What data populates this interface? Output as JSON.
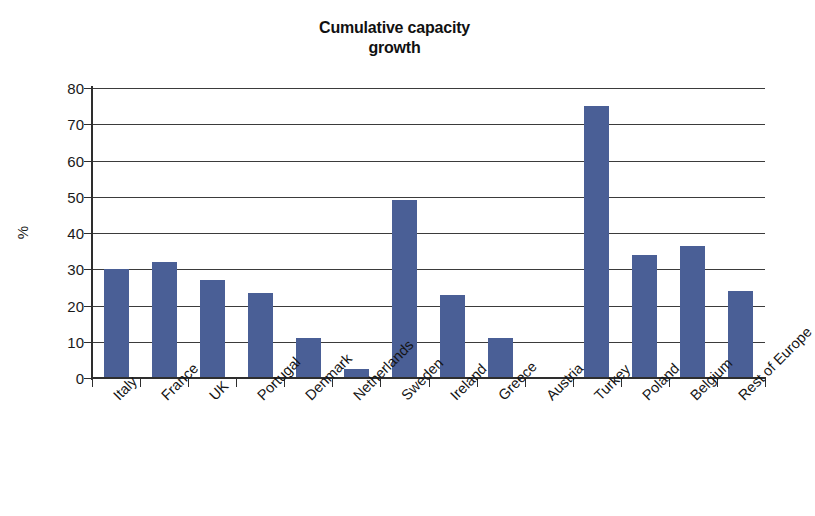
{
  "chart_data": {
    "type": "bar",
    "title": "Cumulative capacity growth",
    "title_lines": [
      "Cumulative capacity",
      "growth"
    ],
    "xlabel": "",
    "ylabel": "%",
    "ylim": [
      0,
      80
    ],
    "yticks": [
      0,
      10,
      20,
      30,
      40,
      50,
      60,
      70,
      80
    ],
    "ytick_labels": [
      "0",
      "10",
      "20",
      "30",
      "40",
      "50",
      "60",
      "70",
      "80"
    ],
    "grid": true,
    "legend": false,
    "bar_color": "#4a5f96",
    "categories": [
      "Italy",
      "France",
      "UK",
      "Portugal",
      "Denmark",
      "Netherlands",
      "Sweden",
      "Ireland",
      "Greece",
      "Austria",
      "Turkey",
      "Poland",
      "Belgium",
      "Rest of Europe"
    ],
    "values": [
      30,
      32,
      27,
      23.5,
      11,
      2.5,
      49,
      23,
      11,
      0,
      75,
      34,
      36.5,
      24
    ]
  }
}
